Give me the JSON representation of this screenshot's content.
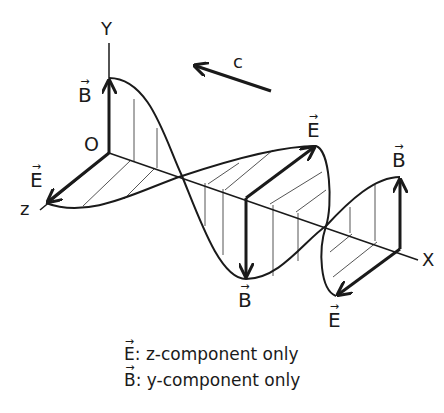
{
  "diagram": {
    "axes": {
      "y_label": "Y",
      "z_label": "z",
      "x_label": "X",
      "origin_label": "O"
    },
    "propagation": {
      "label": "c",
      "direction": "toward -x (upper-left)"
    },
    "vectors": [
      {
        "id": "B1",
        "symbol": "B",
        "arrow": "→",
        "direction": "up (+y) at origin"
      },
      {
        "id": "E1",
        "symbol": "E",
        "arrow": "→",
        "direction": "+z at origin"
      },
      {
        "id": "E2",
        "symbol": "E",
        "arrow": "→",
        "direction": "-z at half wavelength"
      },
      {
        "id": "B2",
        "symbol": "B",
        "arrow": "→",
        "direction": "down (-y) at half wavelength"
      },
      {
        "id": "B3",
        "symbol": "B",
        "arrow": "→",
        "direction": "up (+y) at full wavelength"
      },
      {
        "id": "E3",
        "symbol": "E",
        "arrow": "→",
        "direction": "+z at full wavelength"
      }
    ],
    "caption": {
      "line1_symbol": "E",
      "line1_text": ": z-component only",
      "line2_symbol": "B",
      "line2_text": ": y-component only"
    },
    "colors": {
      "stroke": "#1a1a1a",
      "hatch": "#555555",
      "background": "#ffffff"
    }
  }
}
